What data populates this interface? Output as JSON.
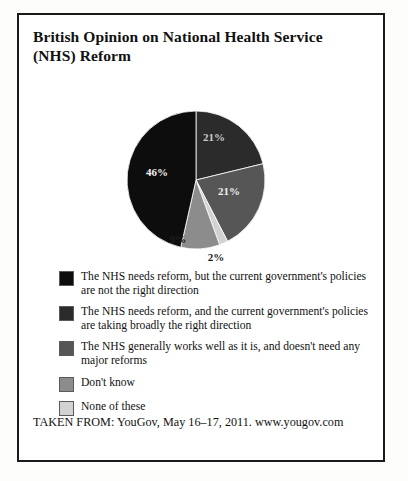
{
  "title": "British Opinion on National Health Service (NHS) Reform",
  "footer": "TAKEN FROM: YouGov, May 16–17, 2011. www.yougov.com",
  "chart_data": {
    "type": "pie",
    "title": "British Opinion on National Health Service (NHS) Reform",
    "categories": [
      "The NHS needs reform, but the current government's policies are not the right direction",
      "The NHS needs reform, and the current government's policies are taking broadly the right direction",
      "The NHS generally works well as it is, and doesn't need any major reforms",
      "Don't know",
      "None of these"
    ],
    "values": [
      46,
      21,
      21,
      9,
      2
    ],
    "value_labels": [
      "46%",
      "21%",
      "21%",
      "9%",
      "2%"
    ],
    "colors": [
      "#0d0d0d",
      "#2b2b2b",
      "#565656",
      "#8c8c8c",
      "#d2d2d2"
    ],
    "legend_position": "below",
    "grid": false,
    "source": "YouGov, May 16–17, 2011. www.yougov.com"
  },
  "slices": [
    {
      "label": "21%",
      "value": 21,
      "color": "#2b2b2b",
      "label_color": "#cccccc",
      "lx": 214,
      "ly": 126
    },
    {
      "label": "21%",
      "value": 21,
      "color": "#565656",
      "label_color": "#f0f0f0",
      "lx": 229,
      "ly": 180
    },
    {
      "label": "2%",
      "value": 2,
      "color": "#d2d2d2",
      "label_color": "#1a1a1a",
      "lx": 216,
      "ly": 246
    },
    {
      "label": "9%",
      "value": 9,
      "color": "#8c8c8c",
      "label_color": "#1d1d1d",
      "lx": 178,
      "ly": 228
    },
    {
      "label": "46%",
      "value": 46,
      "color": "#0d0d0d",
      "label_color": "#f2f2f2",
      "lx": 157,
      "ly": 161
    }
  ],
  "legend": {
    "items": [
      {
        "color": "#0d0d0d",
        "label": "The NHS needs reform, but the current government's policies are not the right direction"
      },
      {
        "color": "#2b2b2b",
        "label": "The NHS needs reform, and the current government's policies are taking broadly the right direction"
      },
      {
        "color": "#565656",
        "label": "The NHS generally works well as it is, and doesn't need any major reforms"
      },
      {
        "color": "#8c8c8c",
        "label": "Don't know"
      },
      {
        "color": "#d2d2d2",
        "label": "None of these"
      }
    ]
  }
}
